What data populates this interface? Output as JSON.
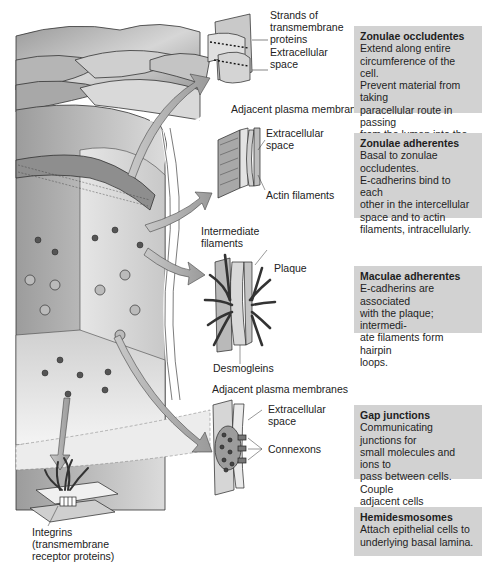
{
  "figure": {
    "colors": {
      "box_fill": "#d2d2d2",
      "cell_light": "#f2f2f2",
      "cell_mid": "#bdbdbd",
      "cell_dark": "#7a7a7a",
      "arrow_fill": "#b0b0b0",
      "outline": "#333333"
    },
    "callouts": {
      "tight_junction": {
        "strands": "Strands of\ntransmembrane\nproteins",
        "extracellular": "Extracellular\nspace",
        "membranes": "Adjacent plasma membranes"
      },
      "zonula_adherens": {
        "extracellular": "Extracellular\nspace",
        "actin": "Actin filaments"
      },
      "desmosome": {
        "intermediate": "Intermediate\nfilaments",
        "plaque": "Plaque",
        "desmogleins": "Desmogleins",
        "membranes": "Adjacent plasma membranes"
      },
      "gap_junction": {
        "extracellular": "Extracellular\nspace",
        "connexons": "Connexons"
      },
      "hemidesmosome": {
        "integrins": "Integrins\n(transmembrane\nreceptor proteins)"
      }
    },
    "descriptions": [
      {
        "title": "Zonulae occludentes",
        "text": "Extend along entire\ncircumference of the cell.\nPrevent material from taking\nparacellular route in passing\nfrom the lumen into the\nconnective tissues."
      },
      {
        "title": "Zonulae adherentes",
        "text": "Basal to zonulae\noccludentes.\nE-cadherins bind to each\nother in the intercellular\nspace and to actin\nfilaments, intracellularly."
      },
      {
        "title": "Maculae adherentes",
        "text": "E-cadherins are associated\nwith the plaque; intermedi-\nate filaments form hairpin\nloops."
      },
      {
        "title": "Gap junctions",
        "text": "Communicating junctions for\nsmall molecules and ions to\npass between cells. Couple\nadjacent cells metabolically\nand electrically."
      },
      {
        "title": "Hemidesmosomes",
        "text": "Attach epithelial cells to\nunderlying basal lamina."
      }
    ]
  }
}
